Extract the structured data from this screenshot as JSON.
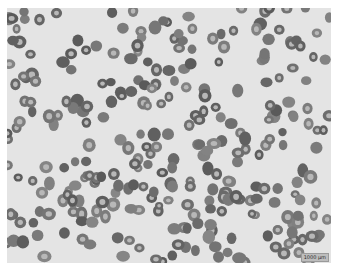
{
  "image": {
    "description": "Grayscale light micrograph of a blood smear showing many red blood cells",
    "background_color": "#e4e4e4",
    "cell_color": "#6e6e6e",
    "cell_center_color": "#b8b8b8",
    "cell_count_approx": 300
  },
  "scale_bar": {
    "label": "1000 μm"
  },
  "generator": {
    "seed": 7,
    "count": 300,
    "width": 324,
    "height": 255
  }
}
